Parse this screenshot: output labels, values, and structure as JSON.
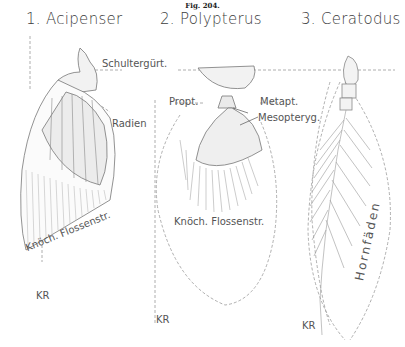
{
  "figure": {
    "number_label": "Fig. 204.",
    "panels": [
      {
        "heading": "1. Acipenser",
        "labels": {
          "shoulder_girdle": "Schultergürt.",
          "radials": "Radien",
          "bony_fin_rays": "Knöch. Flossenstr.",
          "kr": "KR"
        }
      },
      {
        "heading": "2. Polypterus",
        "labels": {
          "propterygium": "Propt.",
          "metapterygium": "Metapt.",
          "mesopterygium": "Mesopteryg.",
          "bony_fin_rays": "Knöch. Flossenstr.",
          "kr": "KR"
        }
      },
      {
        "heading": "3. Ceratodus",
        "labels": {
          "horn_fibers": "Hornfäden",
          "kr": "KR"
        }
      }
    ]
  }
}
